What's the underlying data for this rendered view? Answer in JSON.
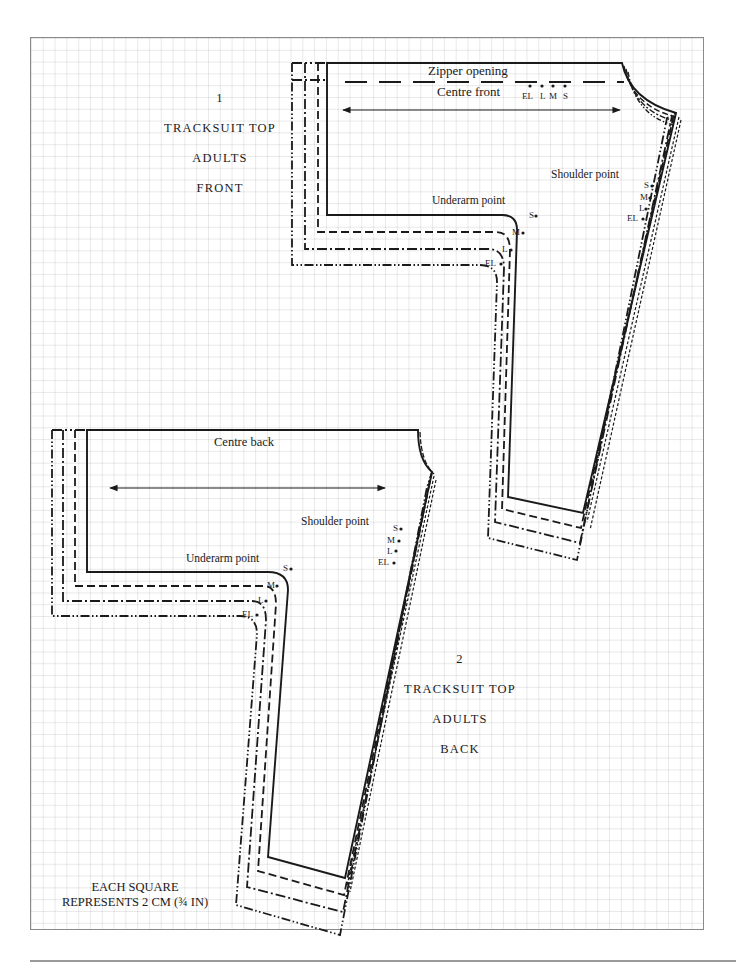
{
  "page": {
    "grid_note": {
      "line1": "EACH SQUARE",
      "line2": "REPRESENTS 2 CM (¾ IN)"
    },
    "legend_line_styles": {
      "S": "solid",
      "M": "dashed",
      "L": "dash-dot",
      "EL": "dash-dot-dot"
    },
    "colors": {
      "ink": "#1a1a1a",
      "grid": "#e6e6e6",
      "frame": "#8a8a8a"
    }
  },
  "piece_front": {
    "number": "1",
    "title": "TRACKSUIT TOP",
    "group": "ADULTS",
    "view": "FRONT",
    "labels": {
      "zipper": "Zipper opening",
      "centre": "Centre front",
      "shoulder": "Shoulder point",
      "underarm": "Underarm point"
    },
    "zipper_sizes": [
      "EL",
      "L",
      "M",
      "S"
    ],
    "shoulder_sizes": [
      "S",
      "M",
      "L",
      "EL"
    ],
    "underarm_sizes": [
      "S",
      "M",
      "L",
      "EL"
    ]
  },
  "piece_back": {
    "number": "2",
    "title": "TRACKSUIT TOP",
    "group": "ADULTS",
    "view": "BACK",
    "labels": {
      "centre": "Centre back",
      "shoulder": "Shoulder point",
      "underarm": "Underarm point"
    },
    "shoulder_sizes": [
      "S",
      "M",
      "L",
      "EL"
    ],
    "underarm_sizes": [
      "S",
      "M",
      "L",
      "EL"
    ]
  }
}
